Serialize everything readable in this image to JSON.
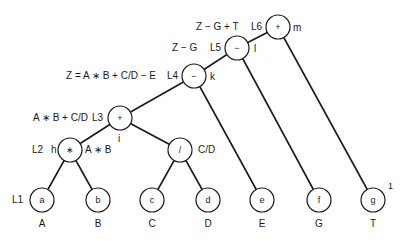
{
  "diagram": {
    "type": "expression-tree",
    "internal_nodes": [
      {
        "id": "m",
        "op": "+",
        "level": "L6",
        "expr": "Z − G + T"
      },
      {
        "id": "l",
        "op": "−",
        "level": "L5",
        "expr": "Z − G"
      },
      {
        "id": "k",
        "op": "−",
        "level": "L4",
        "expr": "Z = A ∗ B + C/D − E"
      },
      {
        "id": "i",
        "op": "+",
        "level": "L3",
        "expr": "A ∗ B + C/D"
      },
      {
        "id": "h",
        "op": "∗",
        "level": "L2",
        "expr": "A ∗ B"
      },
      {
        "id": "div",
        "op": "/",
        "level": "",
        "expr": "C/D"
      }
    ],
    "leaves": [
      {
        "id": "a",
        "operand": "A",
        "level": "L1"
      },
      {
        "id": "b",
        "operand": "B"
      },
      {
        "id": "c",
        "operand": "C"
      },
      {
        "id": "d",
        "operand": "D"
      },
      {
        "id": "e",
        "operand": "E"
      },
      {
        "id": "f",
        "operand": "G"
      },
      {
        "id": "g",
        "operand": "T"
      }
    ],
    "footnote": "1"
  },
  "labels": {
    "m_expr": "Z − G + T",
    "m_level": "L6",
    "m_op": "+",
    "m_id": "m",
    "l_expr": "Z − G",
    "l_level": "L5",
    "l_op": "−",
    "l_id": "l",
    "k_expr": "Z = A ∗ B + C/D − E",
    "k_level": "L4",
    "k_op": "−",
    "k_id": "k",
    "i_expr": "A ∗ B + C/D",
    "i_level": "L3",
    "i_op": "+",
    "i_id": "i",
    "h_level": "L2",
    "h_id": "h",
    "h_op": "∗",
    "h_expr": "A ∗ B",
    "div_op": "/",
    "div_expr": "C/D",
    "l1": "L1",
    "a": "a",
    "b": "b",
    "c": "c",
    "d": "d",
    "e": "e",
    "f": "f",
    "g": "g",
    "A": "A",
    "B": "B",
    "C": "C",
    "D": "D",
    "E": "E",
    "G": "G",
    "T": "T",
    "footnote": "1"
  }
}
